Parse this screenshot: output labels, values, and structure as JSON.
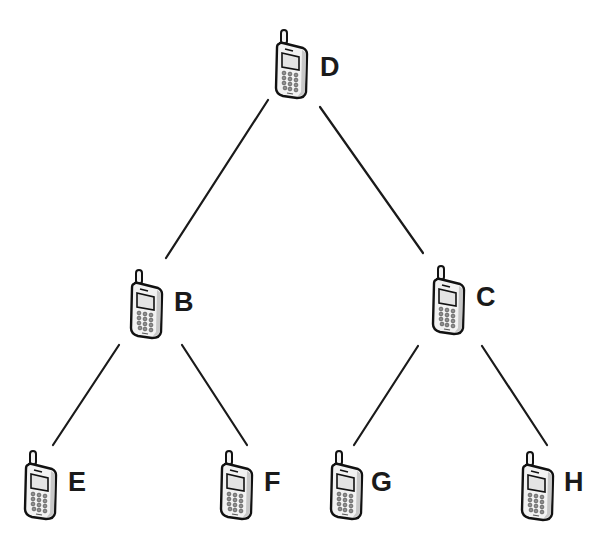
{
  "diagram": {
    "title": "",
    "type": "tree",
    "colors": {
      "background": "#ffffff",
      "line": "#1a1a1a",
      "phone_body": "#f2f2f2",
      "phone_outline": "#111111",
      "screen": "#e6e6e6",
      "keypad": "#9a9a9a"
    },
    "nodes": [
      {
        "id": "D",
        "label": "D",
        "icon": "mobile-phone-icon",
        "x": 275,
        "y": 30,
        "label_x": 320,
        "label_y": 76
      },
      {
        "id": "B",
        "label": "B",
        "icon": "mobile-phone-icon",
        "x": 130,
        "y": 270,
        "label_x": 174,
        "label_y": 311
      },
      {
        "id": "C",
        "label": "C",
        "icon": "mobile-phone-icon",
        "x": 432,
        "y": 266,
        "label_x": 476,
        "label_y": 306
      },
      {
        "id": "E",
        "label": "E",
        "icon": "mobile-phone-icon",
        "x": 24,
        "y": 451,
        "label_x": 68,
        "label_y": 491
      },
      {
        "id": "F",
        "label": "F",
        "icon": "mobile-phone-icon",
        "x": 220,
        "y": 451,
        "label_x": 264,
        "label_y": 491
      },
      {
        "id": "G",
        "label": "G",
        "icon": "mobile-phone-icon",
        "x": 330,
        "y": 451,
        "label_x": 371,
        "label_y": 491
      },
      {
        "id": "H",
        "label": "H",
        "icon": "mobile-phone-icon",
        "x": 521,
        "y": 452,
        "label_x": 564,
        "label_y": 491
      }
    ],
    "edges": [
      {
        "from": "D",
        "to": "B",
        "x1": 268,
        "y1": 100,
        "x2": 166,
        "y2": 258
      },
      {
        "from": "D",
        "to": "C",
        "x1": 320,
        "y1": 107,
        "x2": 423,
        "y2": 253
      },
      {
        "from": "B",
        "to": "E",
        "x1": 119,
        "y1": 345,
        "x2": 53,
        "y2": 445
      },
      {
        "from": "B",
        "to": "F",
        "x1": 182,
        "y1": 345,
        "x2": 247,
        "y2": 445
      },
      {
        "from": "C",
        "to": "G",
        "x1": 418,
        "y1": 346,
        "x2": 354,
        "y2": 445
      },
      {
        "from": "C",
        "to": "H",
        "x1": 482,
        "y1": 346,
        "x2": 547,
        "y2": 445
      }
    ]
  }
}
